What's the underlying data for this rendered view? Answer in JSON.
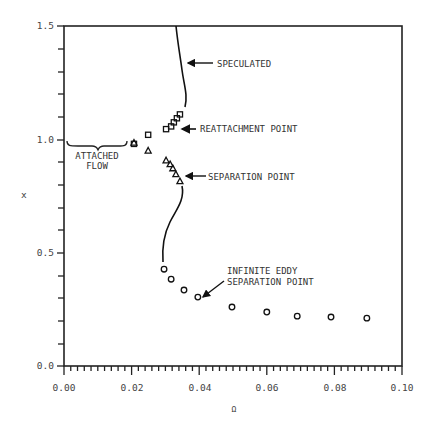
{
  "chart_data": {
    "type": "scatter",
    "title": "",
    "xlabel": "Ω",
    "ylabel": "x",
    "xlim": [
      0.0,
      0.1
    ],
    "ylim": [
      0.0,
      1.5
    ],
    "x_ticks": [
      "0.00",
      "0.02",
      "0.04",
      "0.06",
      "0.08",
      "0.10"
    ],
    "y_ticks": [
      "0.0",
      "0.5",
      "1.0",
      "1.5"
    ],
    "grid": false,
    "series": [
      {
        "name": "Reattachment point",
        "marker": "square",
        "points": [
          [
            0.0207,
            0.98
          ],
          [
            0.0249,
            1.02
          ],
          [
            0.0302,
            1.045
          ],
          [
            0.0317,
            1.057
          ],
          [
            0.0325,
            1.075
          ],
          [
            0.0334,
            1.093
          ],
          [
            0.0343,
            1.11
          ]
        ]
      },
      {
        "name": "Separation point",
        "marker": "triangle",
        "points": [
          [
            0.0207,
            0.985
          ],
          [
            0.0249,
            0.95
          ],
          [
            0.0302,
            0.907
          ],
          [
            0.0314,
            0.89
          ],
          [
            0.0322,
            0.872
          ],
          [
            0.0331,
            0.846
          ],
          [
            0.0343,
            0.815
          ]
        ]
      },
      {
        "name": "Infinite eddy separation point",
        "marker": "circle",
        "points": [
          [
            0.0296,
            0.427
          ],
          [
            0.0317,
            0.383
          ],
          [
            0.0355,
            0.335
          ],
          [
            0.0396,
            0.304
          ],
          [
            0.0497,
            0.26
          ],
          [
            0.06,
            0.238
          ],
          [
            0.069,
            0.22
          ],
          [
            0.079,
            0.216
          ],
          [
            0.0896,
            0.211
          ]
        ]
      }
    ],
    "annotations": [
      "SPECULATED",
      "REATTACHMENT POINT",
      "SEPARATION POINT",
      "INFINITE EDDY",
      "SEPARATION POINT",
      "ATTACHED",
      "FLOW"
    ]
  },
  "labels": {
    "speculated": "SPECULATED",
    "reattachment": "REATTACHMENT POINT",
    "separation": "SEPARATION POINT",
    "infinite_eddy_1": "INFINITE EDDY",
    "infinite_eddy_2": "SEPARATION POINT",
    "attached_1": "ATTACHED",
    "attached_2": "FLOW",
    "xlabel": "Ω",
    "ylabel": "x",
    "xticks": [
      "0.00",
      "0.02",
      "0.04",
      "0.06",
      "0.08",
      "0.10"
    ],
    "yticks": [
      "0.0",
      "0.5",
      "1.0",
      "1.5"
    ]
  }
}
